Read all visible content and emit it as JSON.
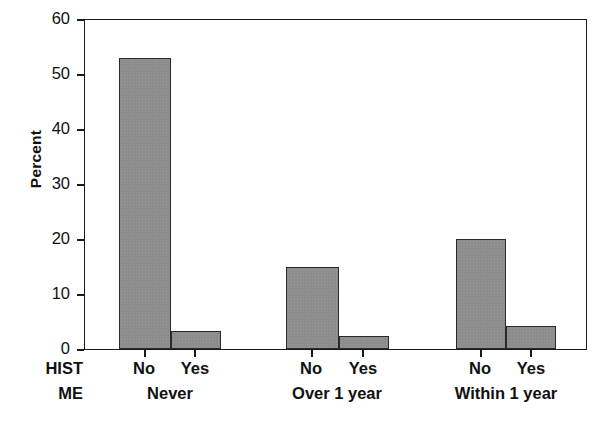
{
  "chart_data": {
    "type": "bar",
    "title": "",
    "subtitle": "",
    "xlabel": "",
    "ylabel": "Percent",
    "ylim": [
      0,
      60
    ],
    "yticks": [
      0,
      10,
      20,
      30,
      40,
      50,
      60
    ],
    "ytick_labels": [
      "0",
      "10",
      "20",
      "30",
      "40",
      "50",
      "60"
    ],
    "grid": false,
    "legend": null,
    "grouped": true,
    "group_axis_names": [
      "HIST",
      "ME"
    ],
    "categories": [
      "Never",
      "Over 1 year",
      "Within 1 year"
    ],
    "subcategories": [
      "No",
      "Yes"
    ],
    "bar_color": "#8d8d8d",
    "bar_edge_color": "#2a2a2a",
    "series": [
      {
        "name": "No",
        "values": [
          53.0,
          15.0,
          20.0
        ]
      },
      {
        "name": "Yes",
        "values": [
          3.3,
          2.4,
          4.2
        ]
      }
    ],
    "bars": [
      {
        "group": "Never",
        "sub": "No",
        "value": 53.0
      },
      {
        "group": "Never",
        "sub": "Yes",
        "value": 3.3
      },
      {
        "group": "Over 1 year",
        "sub": "No",
        "value": 15.0
      },
      {
        "group": "Over 1 year",
        "sub": "Yes",
        "value": 2.4
      },
      {
        "group": "Within 1 year",
        "sub": "No",
        "value": 20.0
      },
      {
        "group": "Within 1 year",
        "sub": "Yes",
        "value": 4.2
      }
    ]
  },
  "axis": {
    "y_label": "Percent",
    "y_ticks": [
      "0",
      "10",
      "20",
      "30",
      "40",
      "50",
      "60"
    ],
    "row_var_line1": "HIST",
    "row_var_line2": "ME",
    "sub_labels": [
      "No",
      "Yes",
      "No",
      "Yes",
      "No",
      "Yes"
    ],
    "group_labels": [
      "Never",
      "Over 1 year",
      "Within 1 year"
    ]
  }
}
